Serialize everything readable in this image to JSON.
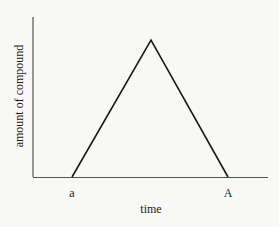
{
  "chart_data": {
    "type": "line",
    "title": "",
    "xlabel": "time",
    "ylabel": "amount of compound",
    "x_tick_labels": [
      "a",
      "A"
    ],
    "series": [
      {
        "name": "amount of compound",
        "points": [
          {
            "x": "a",
            "y": 0
          },
          {
            "x": "peak",
            "y": 1
          },
          {
            "x": "A",
            "y": 0
          }
        ]
      }
    ],
    "grid": false,
    "legend": null
  },
  "colors": {
    "background": "#f8f8f6",
    "line": "#1a1a1a",
    "axis": "#555555"
  },
  "geometry": {
    "axis_origin": [
      33,
      177
    ],
    "y_axis_top": 17,
    "x_axis_right": 268,
    "triangle": [
      [
        72,
        177
      ],
      [
        151,
        40
      ],
      [
        228,
        177
      ]
    ]
  }
}
